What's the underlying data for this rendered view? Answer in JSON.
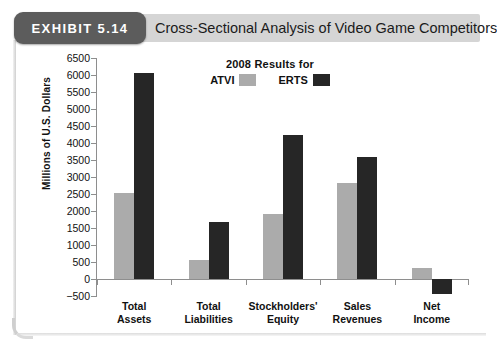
{
  "header": {
    "exhibit_tab": "EXHIBIT 5.14",
    "title": "Cross-Sectional Analysis of Video Game Competitors"
  },
  "chart_data": {
    "type": "bar",
    "title": "",
    "legend_title": "2008 Results for",
    "legend_position": "top-center",
    "categories": [
      "Total Assets",
      "Total Liabilities",
      "Stockholders' Equity",
      "Sales Revenues",
      "Net Income"
    ],
    "category_lines": [
      [
        "Total",
        "Assets"
      ],
      [
        "Total",
        "Liabilities"
      ],
      [
        "Stockholders'",
        "Equity"
      ],
      [
        "Sales",
        "Revenues"
      ],
      [
        "Net",
        "Income"
      ]
    ],
    "series": [
      {
        "name": "ATVI",
        "color": "#ababab",
        "values": [
          2520,
          550,
          1900,
          2820,
          310
        ]
      },
      {
        "name": "ERTS",
        "color": "#262626",
        "values": [
          6050,
          1680,
          4250,
          3580,
          -450
        ]
      }
    ],
    "xlabel": "",
    "ylabel": "Millions of U.S. Dollars",
    "ylim": [
      -500,
      6500
    ],
    "ytick_step": 500,
    "yticks": [
      6500,
      6000,
      5500,
      5000,
      4500,
      4000,
      3500,
      3000,
      2500,
      2000,
      1500,
      1000,
      500,
      0,
      -500
    ],
    "ytick_labels": [
      "6500",
      "6000",
      "5500",
      "5000",
      "4500",
      "4000",
      "3500",
      "3000",
      "2500",
      "2000",
      "1500",
      "1000",
      "500",
      "0",
      "-500"
    ],
    "grid": false
  },
  "colors": {
    "exhibit_tab_bg": "#5c5c5c",
    "header_band_bg": "#d5d5d5",
    "axis": "#8e8e8e",
    "text": "#111111",
    "atvi": "#ababab",
    "erts": "#262626"
  }
}
